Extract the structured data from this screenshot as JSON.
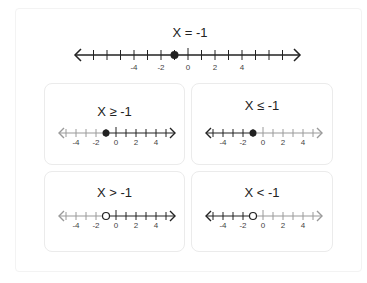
{
  "main": {
    "title": "X = -1",
    "number_line": {
      "min_tick": -7,
      "max_tick": 7,
      "labels": [
        "-4",
        "-2",
        "0",
        "2",
        "4"
      ],
      "point": -1,
      "point_type": "closed"
    }
  },
  "cards": [
    {
      "title": "X ≥ -1",
      "point": -1,
      "point_type": "closed",
      "direction": "right"
    },
    {
      "title": "X ≤ -1",
      "point": -1,
      "point_type": "closed",
      "direction": "left"
    },
    {
      "title": "X > -1",
      "point": -1,
      "point_type": "open",
      "direction": "right"
    },
    {
      "title": "X < -1",
      "point": -1,
      "point_type": "open",
      "direction": "left"
    }
  ],
  "small_line": {
    "min_tick": -5,
    "max_tick": 5,
    "labels": [
      "-4",
      "-2",
      "0",
      "2",
      "4"
    ]
  },
  "colors": {
    "dark": "#222222",
    "faded": "#9a9a9a",
    "card_border": "#ebebeb"
  }
}
